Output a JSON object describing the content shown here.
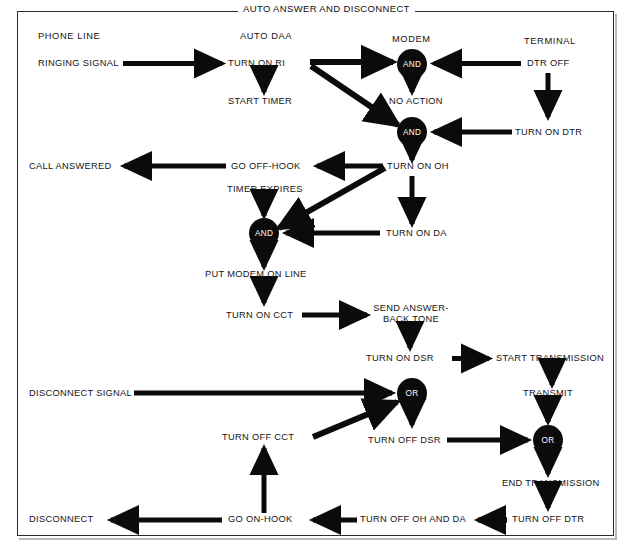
{
  "diagram": {
    "title": "AUTO ANSWER AND DISCONNECT",
    "type": "flowchart",
    "columns": [
      {
        "id": "phone-line",
        "label": "PHONE LINE"
      },
      {
        "id": "auto-daa",
        "label": "AUTO DAA"
      },
      {
        "id": "modem",
        "label": "MODEM"
      },
      {
        "id": "terminal",
        "label": "TERMINAL"
      }
    ],
    "gates": [
      {
        "id": "and-1",
        "label": "AND",
        "shape": "circle"
      },
      {
        "id": "and-2",
        "label": "AND",
        "shape": "circle"
      },
      {
        "id": "and-3",
        "label": "AND",
        "shape": "circle"
      },
      {
        "id": "or-1",
        "label": "OR",
        "shape": "circle"
      },
      {
        "id": "or-2",
        "label": "OR",
        "shape": "circle"
      }
    ],
    "nodes": [
      {
        "id": "ringing-signal",
        "label": "RINGING SIGNAL"
      },
      {
        "id": "turn-on-ri",
        "label": "TURN ON RI"
      },
      {
        "id": "start-timer",
        "label": "START TIMER"
      },
      {
        "id": "dtr-off",
        "label": "DTR OFF"
      },
      {
        "id": "no-action",
        "label": "NO ACTION"
      },
      {
        "id": "turn-on-dtr",
        "label": "TURN ON DTR"
      },
      {
        "id": "call-answered",
        "label": "CALL ANSWERED"
      },
      {
        "id": "go-off-hook",
        "label": "GO OFF-HOOK"
      },
      {
        "id": "turn-on-oh",
        "label": "TURN ON OH"
      },
      {
        "id": "timer-expires",
        "label": "TIMER EXPIRES"
      },
      {
        "id": "turn-on-da",
        "label": "TURN ON DA"
      },
      {
        "id": "put-modem-on-line",
        "label": "PUT MODEM ON LINE"
      },
      {
        "id": "turn-on-cct",
        "label": "TURN ON CCT"
      },
      {
        "id": "send-answer-back-tone",
        "label": "SEND ANSWER-\nBACK TONE"
      },
      {
        "id": "turn-on-dsr",
        "label": "TURN ON DSR"
      },
      {
        "id": "start-transmission",
        "label": "START TRANSMISSION"
      },
      {
        "id": "disconnect-signal",
        "label": "DISCONNECT SIGNAL"
      },
      {
        "id": "transmit",
        "label": "TRANSMIT"
      },
      {
        "id": "turn-off-cct",
        "label": "TURN OFF CCT"
      },
      {
        "id": "turn-off-dsr",
        "label": "TURN OFF DSR"
      },
      {
        "id": "end-transmission",
        "label": "END TRANSMISSION"
      },
      {
        "id": "disconnect",
        "label": "DISCONNECT"
      },
      {
        "id": "go-on-hook",
        "label": "GO ON-HOOK"
      },
      {
        "id": "turn-off-oh-and-da",
        "label": "TURN OFF OH AND DA"
      },
      {
        "id": "turn-off-dtr",
        "label": "TURN OFF DTR"
      }
    ],
    "edges": [
      {
        "from": "ringing-signal",
        "to": "turn-on-ri"
      },
      {
        "from": "turn-on-ri",
        "to": "start-timer"
      },
      {
        "from": "turn-on-ri",
        "to": "and-1"
      },
      {
        "from": "turn-on-ri",
        "to": "and-2"
      },
      {
        "from": "dtr-off",
        "to": "and-1"
      },
      {
        "from": "and-1",
        "to": "no-action"
      },
      {
        "from": "dtr-off",
        "to": "turn-on-dtr"
      },
      {
        "from": "turn-on-dtr",
        "to": "and-2"
      },
      {
        "from": "and-2",
        "to": "turn-on-oh"
      },
      {
        "from": "turn-on-oh",
        "to": "go-off-hook"
      },
      {
        "from": "turn-on-oh",
        "to": "and-3"
      },
      {
        "from": "turn-on-oh",
        "to": "turn-on-da"
      },
      {
        "from": "go-off-hook",
        "to": "call-answered"
      },
      {
        "from": "timer-expires",
        "to": "and-3"
      },
      {
        "from": "turn-on-da",
        "to": "and-3"
      },
      {
        "from": "and-3",
        "to": "put-modem-on-line"
      },
      {
        "from": "put-modem-on-line",
        "to": "turn-on-cct"
      },
      {
        "from": "turn-on-cct",
        "to": "send-answer-back-tone"
      },
      {
        "from": "send-answer-back-tone",
        "to": "turn-on-dsr"
      },
      {
        "from": "turn-on-dsr",
        "to": "start-transmission"
      },
      {
        "from": "start-transmission",
        "to": "transmit"
      },
      {
        "from": "disconnect-signal",
        "to": "or-1"
      },
      {
        "from": "turn-off-cct",
        "to": "or-1"
      },
      {
        "from": "or-1",
        "to": "turn-off-dsr"
      },
      {
        "from": "transmit",
        "to": "or-2"
      },
      {
        "from": "turn-off-dsr",
        "to": "or-2"
      },
      {
        "from": "or-2",
        "to": "end-transmission"
      },
      {
        "from": "end-transmission",
        "to": "turn-off-dtr"
      },
      {
        "from": "turn-off-dtr",
        "to": "turn-off-oh-and-da"
      },
      {
        "from": "turn-off-oh-and-da",
        "to": "go-on-hook"
      },
      {
        "from": "go-on-hook",
        "to": "turn-off-cct"
      },
      {
        "from": "go-on-hook",
        "to": "disconnect"
      }
    ],
    "colors": {
      "ink": "#111111",
      "gate_fill": "#0b0b0b",
      "gate_text": "#ffffff",
      "background": "#ffffff",
      "frame": "#2b2b2b",
      "page": "#c9c9c4"
    }
  }
}
